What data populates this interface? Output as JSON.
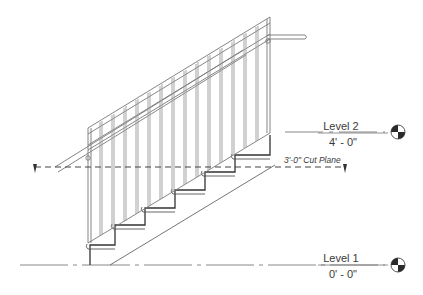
{
  "drawing": {
    "type": "stair-section",
    "cut_plane": {
      "label": "3'-0\" Cut Plane"
    },
    "levels": [
      {
        "name": "Level 2",
        "elevation": "4' - 0\""
      },
      {
        "name": "Level 1",
        "elevation": "0' - 0\""
      }
    ],
    "stair": {
      "risers": 6,
      "treads": 5
    },
    "colors": {
      "line": "#555555",
      "light_line": "#8a8a8a",
      "text": "#3a3a3a",
      "marker_fill": "#2a2a2a"
    }
  }
}
